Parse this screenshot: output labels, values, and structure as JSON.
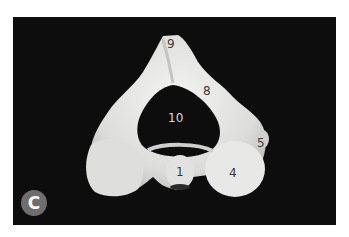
{
  "figure": {
    "panel_letter": "C",
    "colors": {
      "background": "#0d0d0d",
      "bone": "#e6e6e4",
      "badge": "#6e6e6e",
      "label_dark": "#3a3a3a",
      "label_light": "#d8d8d8"
    },
    "labels": [
      {
        "id": "9",
        "text": "9"
      },
      {
        "id": "8",
        "text": "8"
      },
      {
        "id": "10",
        "text": "10"
      },
      {
        "id": "5",
        "text": "5"
      },
      {
        "id": "1",
        "text": "1"
      },
      {
        "id": "4",
        "text": "4"
      }
    ]
  }
}
